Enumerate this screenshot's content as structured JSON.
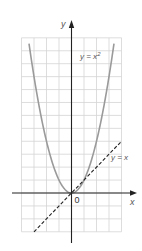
{
  "chart_data": {
    "type": "line",
    "title": "",
    "xlabel": "x",
    "ylabel": "y",
    "origin_label": "0",
    "grid": true,
    "xlim": [
      -4,
      4
    ],
    "ylim": [
      -3,
      12
    ],
    "series": [
      {
        "name": "y = x^2",
        "label": "y = x²",
        "style": "solid",
        "color": "#9a9a9a",
        "x": [
          -3.4,
          -3,
          -2.5,
          -2,
          -1.5,
          -1,
          -0.5,
          0,
          0.5,
          1,
          1.5,
          2,
          2.5,
          3,
          3.4
        ],
        "y": [
          11.56,
          9,
          6.25,
          4,
          2.25,
          1,
          0.25,
          0,
          0.25,
          1,
          2.25,
          4,
          6.25,
          9,
          11.56
        ]
      },
      {
        "name": "y = x",
        "label": "y = x",
        "style": "dashed",
        "color": "#222222",
        "x": [
          -3,
          4
        ],
        "y": [
          -3,
          4
        ]
      }
    ]
  },
  "labels": {
    "y_axis": "y",
    "x_axis": "x",
    "origin": "0",
    "parabola": "y = x²",
    "line": "y = x"
  },
  "colors": {
    "grid": "#d4d4d4",
    "axis": "#222222",
    "parabola": "#9a9a9a",
    "line": "#222222"
  }
}
